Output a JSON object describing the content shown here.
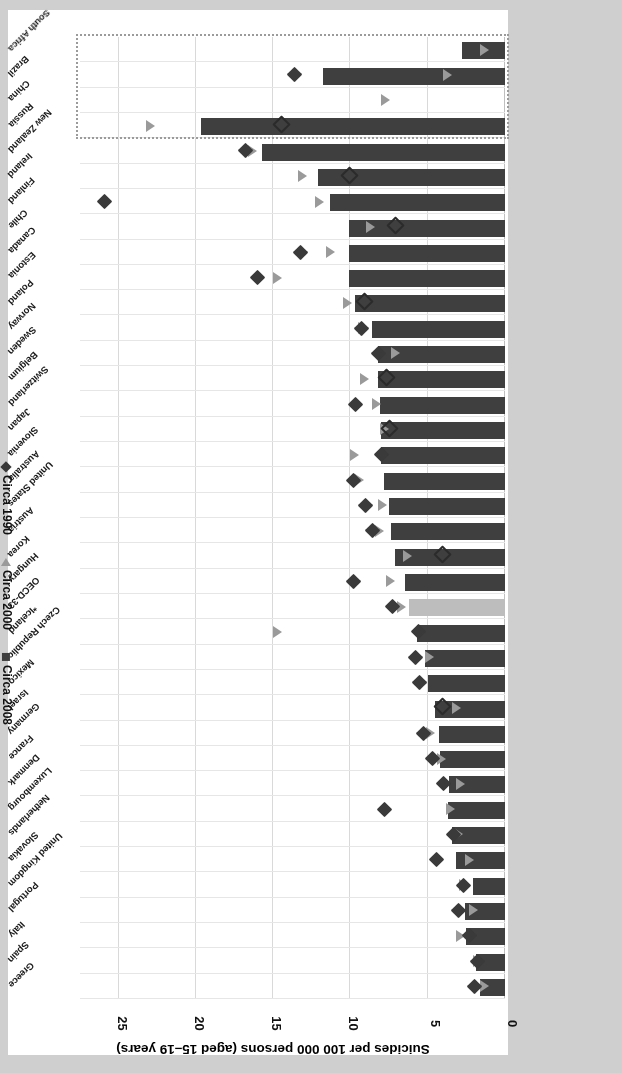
{
  "figure": {
    "axis_title": "Suicides per 100 000 persons (aged 15–19 years)",
    "source": "Source: WHO 2017 (WHO Mortality Database) www.oecd.org/els/family/database.htm"
  },
  "legend": {
    "items": [
      {
        "label": "Circa 2008",
        "marker": "square",
        "color": "#3f3f3f"
      },
      {
        "label": "Circa 2000",
        "marker": "triangle",
        "color": "#9a9a9a"
      },
      {
        "label": "Circa 1990",
        "marker": "diamond",
        "color": "#3a3a3a"
      }
    ]
  },
  "chart_data": {
    "type": "bar",
    "orientation": "horizontal",
    "title": "",
    "xlabel": "Suicides per 100 000 persons (aged 15–19 years)",
    "ylabel": "",
    "xlim": [
      0,
      27.5
    ],
    "xticks": [
      0,
      5,
      10,
      15,
      20,
      25
    ],
    "grid": true,
    "legend_position": "top-left",
    "highlight_category": "OECD-33",
    "highlight_color": "#bdbdbd",
    "bar_color": "#3f3f3f",
    "non_oecd_box": [
      "Russia",
      "China",
      "Brazil",
      "South Africa"
    ],
    "categories": [
      "Greece",
      "Spain",
      "Italy",
      "Portugal",
      "United Kingdom",
      "Slovakia",
      "Netherlands",
      "Luxembourg",
      "Denmark",
      "France",
      "Germany",
      "Israel",
      "Mexico",
      "Czech Republic",
      "*Iceland",
      "OECD-33",
      "Hungary",
      "Korea",
      "Austria",
      "United States",
      "Australia",
      "Slovenia",
      "Japan",
      "Switzerland",
      "Belgium",
      "Sweden",
      "Norway",
      "Poland",
      "Estonia",
      "Canada",
      "Chile",
      "Finland",
      "Ireland",
      "New Zealand",
      "Russia",
      "China",
      "Brazil",
      "South Africa"
    ],
    "series": [
      {
        "name": "Circa 2008",
        "marker": "bar",
        "values": [
          1.6,
          1.9,
          2.5,
          2.6,
          2.1,
          3.2,
          3.4,
          3.7,
          3.6,
          4.2,
          4.3,
          4.5,
          5.0,
          5.2,
          5.7,
          6.2,
          6.5,
          7.1,
          7.4,
          7.5,
          7.8,
          8.0,
          8.0,
          8.1,
          8.2,
          8.2,
          8.6,
          9.7,
          10.1,
          10.1,
          10.1,
          11.3,
          12.1,
          15.7,
          19.7,
          0.0,
          11.8,
          2.8
        ]
      },
      {
        "name": "Circa 2000",
        "marker": "triangle",
        "values": [
          1.6,
          2.1,
          3.2,
          2.3,
          3.0,
          2.6,
          3.3,
          3.8,
          3.2,
          4.4,
          5.1,
          3.4,
          5.6,
          5.2,
          15.0,
          7.0,
          7.7,
          6.6,
          8.4,
          8.2,
          9.7,
          10.0,
          8.1,
          8.6,
          9.4,
          7.4,
          9.5,
          10.5,
          15.0,
          11.6,
          9.0,
          12.3,
          13.4,
          16.6,
          23.2,
          8.0,
          4.0,
          1.6
        ]
      },
      {
        "name": "Circa 1990",
        "marker": "diamond",
        "values": [
          2.0,
          1.8,
          2.3,
          3.0,
          2.7,
          4.4,
          3.3,
          7.8,
          4.0,
          4.7,
          5.3,
          4.0,
          5.5,
          5.8,
          5.6,
          7.3,
          9.8,
          4.0,
          8.6,
          9.0,
          9.8,
          8.0,
          7.4,
          9.7,
          7.6,
          8.2,
          9.3,
          9.0,
          16.0,
          13.2,
          7.0,
          25.9,
          10.0,
          16.8,
          14.4,
          0.0,
          13.6,
          0.0
        ]
      }
    ]
  }
}
